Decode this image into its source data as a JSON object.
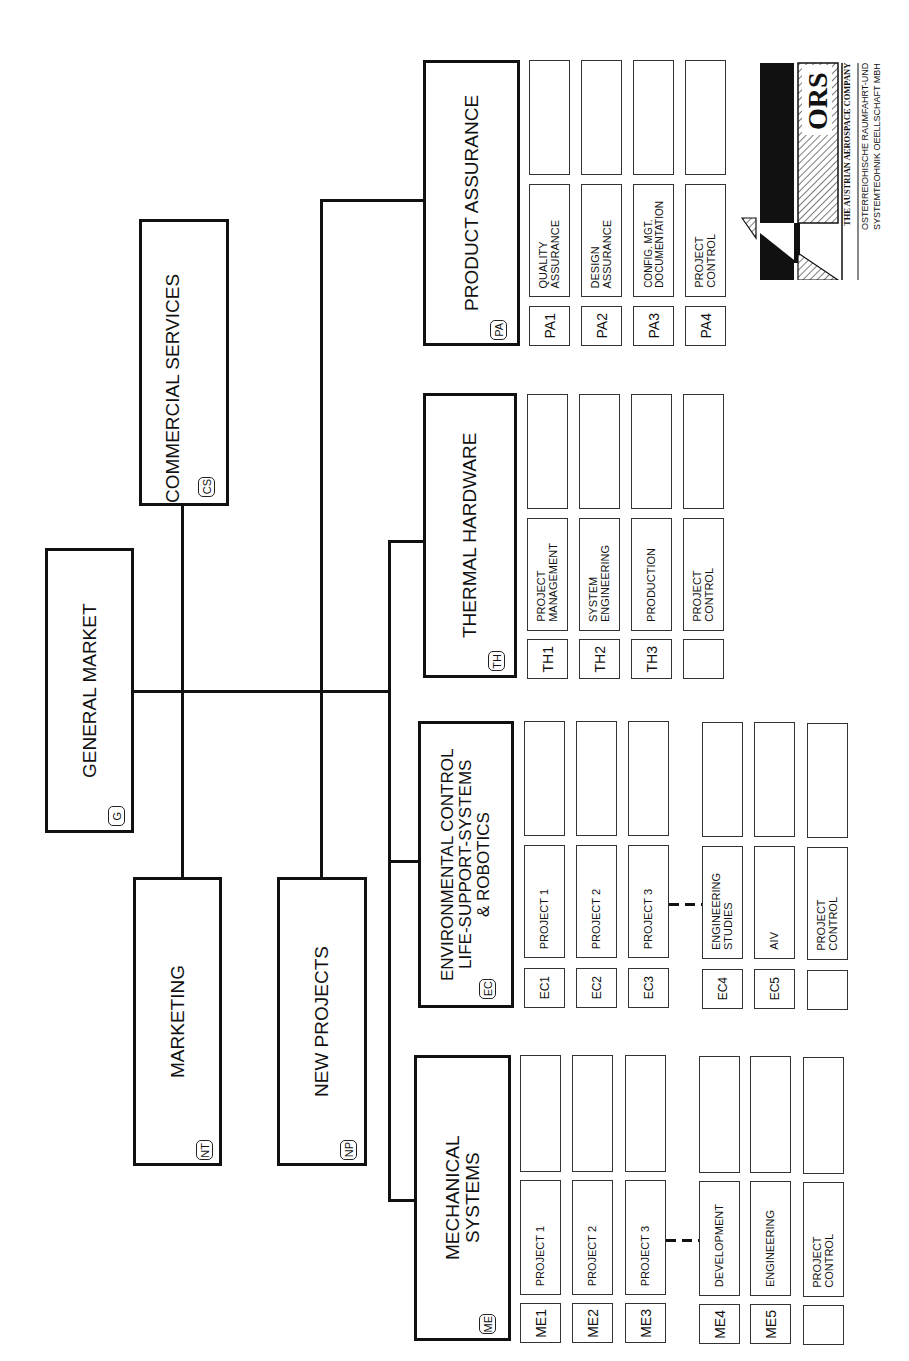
{
  "chart": {
    "orientation": "rotated-90-ccw",
    "top": {
      "title": "GENERAL MARKET",
      "code": "G"
    },
    "staff": [
      {
        "title": "COMMERCIAL SERVICES",
        "code": "CS"
      },
      {
        "title": "MARKETING",
        "code": "NT"
      },
      {
        "title": "NEW PROJECTS",
        "code": "NP"
      }
    ],
    "departments": [
      {
        "title": "PRODUCT ASSURANCE",
        "code": "PA",
        "units": [
          {
            "code": "PA1",
            "label": "QUALITY\nASSURANCE"
          },
          {
            "code": "PA2",
            "label": "DESIGN\nASSURANCE"
          },
          {
            "code": "PA3",
            "label": "CONFIG. MGT.\nDOCUMENTATION"
          },
          {
            "code": "PA4",
            "label": "PROJECT\nCONTROL"
          }
        ]
      },
      {
        "title": "THERMAL HARDWARE",
        "code": "TH",
        "units": [
          {
            "code": "TH1",
            "label": "PROJECT\nMANAGEMENT"
          },
          {
            "code": "TH2",
            "label": "SYSTEM\nENGINEERING"
          },
          {
            "code": "TH3",
            "label": "PRODUCTION"
          },
          {
            "code": "",
            "label": "PROJECT\nCONTROL"
          }
        ]
      },
      {
        "title": "ENVIRONMENTAL CONTROL\nLIFE-SUPPORT-SYSTEMS\n& ROBOTICS",
        "code": "EC",
        "units": [
          {
            "code": "EC1",
            "label": "PROJECT 1"
          },
          {
            "code": "EC2",
            "label": "PROJECT 2"
          },
          {
            "code": "EC3",
            "label": "PROJECT 3"
          },
          {
            "code": "EC4",
            "label": "ENGINEERING\nSTUDIES"
          },
          {
            "code": "EC5",
            "label": "AIV"
          },
          {
            "code": "",
            "label": "PROJECT\nCONTROL"
          }
        ]
      },
      {
        "title": "MECHANICAL\nSYSTEMS",
        "code": "ME",
        "units": [
          {
            "code": "ME1",
            "label": "PROJECT 1"
          },
          {
            "code": "ME2",
            "label": "PROJECT 2"
          },
          {
            "code": "ME3",
            "label": "PROJECT 3"
          },
          {
            "code": "ME4",
            "label": "DEVELOPMENT"
          },
          {
            "code": "ME5",
            "label": "ENGINEERING"
          },
          {
            "code": "",
            "label": "PROJECT\nCONTROL"
          }
        ]
      }
    ]
  },
  "logo": {
    "wordmark": "ORS",
    "tagline": "THE AUSTRIAN AEROSPACE COMPANY",
    "company_line1": "OSTERREIOHISCHE RAUMFAHRT-UND",
    "company_line2": "SYSTEMTEOHNIK OEELLSCHAFT MBH"
  }
}
